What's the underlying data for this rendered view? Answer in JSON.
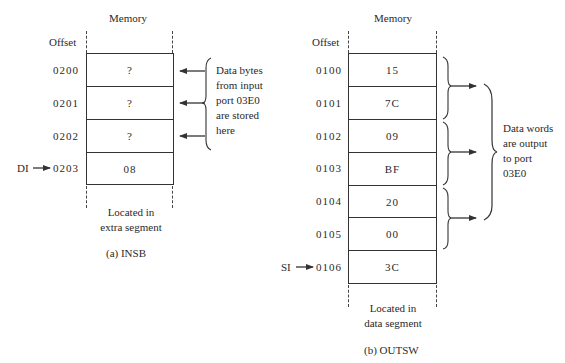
{
  "panel_a": {
    "memory_label": "Memory",
    "offset_label": "Offset",
    "rows": [
      {
        "offset": "0200",
        "value": "?"
      },
      {
        "offset": "0201",
        "value": "?"
      },
      {
        "offset": "0202",
        "value": "?"
      },
      {
        "offset": "0203",
        "value": "08"
      }
    ],
    "pointer": "DI",
    "pointer_row": 3,
    "annotation": [
      "Data bytes",
      "from input",
      "port 03E0",
      "are stored",
      "here"
    ],
    "segment_note": [
      "Located in",
      "extra segment"
    ],
    "caption": "(a) INSB"
  },
  "panel_b": {
    "memory_label": "Memory",
    "offset_label": "Offset",
    "rows": [
      {
        "offset": "0100",
        "value": "15"
      },
      {
        "offset": "0101",
        "value": "7C"
      },
      {
        "offset": "0102",
        "value": "09"
      },
      {
        "offset": "0103",
        "value": "BF"
      },
      {
        "offset": "0104",
        "value": "20"
      },
      {
        "offset": "0105",
        "value": "00"
      },
      {
        "offset": "0106",
        "value": "3C"
      }
    ],
    "pointer": "SI",
    "pointer_row": 6,
    "annotation": [
      "Data words",
      "are output",
      "to port",
      "03E0"
    ],
    "segment_note": [
      "Located in",
      "data segment"
    ],
    "caption": "(b) OUTSW"
  },
  "colors": {
    "line": "#333333",
    "text": "#2a2a2a",
    "pointer_arrow": "#333333"
  }
}
